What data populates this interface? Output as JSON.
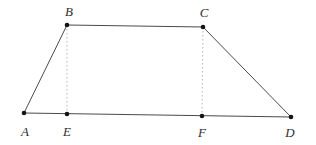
{
  "figure": {
    "width": 316,
    "height": 145,
    "background": "#ffffff",
    "line_color": "#4a4a4a",
    "line_width": 1,
    "dotted_line_color": "#b5b5b5",
    "dotted_dash": "1.5,2.5",
    "point_color": "#141414",
    "point_radius": 2.3,
    "label_color": "#2e2e2e",
    "points": [
      {
        "id": "A",
        "label": "A",
        "x": 24,
        "y": 113,
        "label_x": 25,
        "label_y": 136
      },
      {
        "id": "B",
        "label": "B",
        "x": 67,
        "y": 25,
        "label_x": 69,
        "label_y": 16
      },
      {
        "id": "C",
        "label": "C",
        "x": 203,
        "y": 27,
        "label_x": 204,
        "label_y": 17
      },
      {
        "id": "D",
        "label": "D",
        "x": 291,
        "y": 117,
        "label_x": 290,
        "label_y": 137
      },
      {
        "id": "E",
        "label": "E",
        "x": 67,
        "y": 114,
        "label_x": 67,
        "label_y": 136
      },
      {
        "id": "F",
        "label": "F",
        "x": 202,
        "y": 116,
        "label_x": 202,
        "label_y": 137
      }
    ],
    "edges": [
      {
        "from": "A",
        "to": "B",
        "style": "solid"
      },
      {
        "from": "B",
        "to": "C",
        "style": "solid"
      },
      {
        "from": "C",
        "to": "D",
        "style": "solid"
      },
      {
        "from": "A",
        "to": "D",
        "style": "solid"
      },
      {
        "from": "B",
        "to": "E",
        "style": "dotted"
      },
      {
        "from": "C",
        "to": "F",
        "style": "dotted"
      }
    ]
  }
}
